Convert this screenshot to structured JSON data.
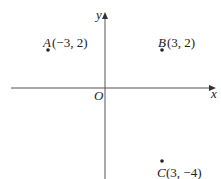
{
  "axes": {
    "x_label": "x",
    "y_label": "y",
    "origin_label": "O"
  },
  "points": [
    {
      "name": "A",
      "coords": "(−3, 2)",
      "x": -3,
      "y": 2
    },
    {
      "name": "B",
      "coords": "(3, 2)",
      "x": 3,
      "y": 2
    },
    {
      "name": "C",
      "coords": "(3, −4)",
      "x": 3,
      "y": -4
    }
  ]
}
